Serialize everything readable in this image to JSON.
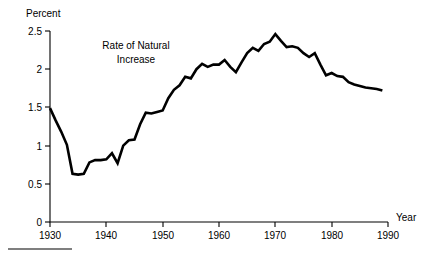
{
  "figure": {
    "background_color": "#ffffff",
    "line_color": "#000000",
    "axis_color": "#000000"
  },
  "labels": {
    "y_axis_title": "Percent",
    "x_axis_title": "Year",
    "annotation_line1": "Rate of Natural",
    "annotation_line2": "Increase"
  },
  "chart_data": {
    "type": "line",
    "title": "",
    "subtitle": "",
    "xlabel": "Year",
    "ylabel": "Percent",
    "xlim": [
      1930,
      1990
    ],
    "ylim": [
      0,
      2.5
    ],
    "grid": false,
    "legend": "none",
    "annotations": [
      {
        "text": "Rate of Natural Increase",
        "x": 1945,
        "y": 2.3
      }
    ],
    "y_ticks": [
      0,
      0.5,
      1,
      1.5,
      2,
      2.5
    ],
    "y_tick_labels": [
      "0",
      "0.5",
      "1",
      "1.5",
      "2",
      "2.5"
    ],
    "x_ticks": [
      1930,
      1940,
      1950,
      1960,
      1970,
      1980,
      1990
    ],
    "x_tick_labels": [
      "1930",
      "1940",
      "1950",
      "1960",
      "1970",
      "1980",
      "1990"
    ],
    "series": [
      {
        "name": "Rate of Natural Increase",
        "color": "#000000",
        "x": [
          1930,
          1931,
          1932,
          1933,
          1934,
          1935,
          1936,
          1937,
          1938,
          1939,
          1940,
          1941,
          1942,
          1943,
          1944,
          1945,
          1946,
          1947,
          1948,
          1949,
          1950,
          1951,
          1952,
          1953,
          1954,
          1955,
          1956,
          1957,
          1958,
          1959,
          1960,
          1961,
          1962,
          1963,
          1964,
          1965,
          1966,
          1967,
          1968,
          1969,
          1970,
          1971,
          1972,
          1973,
          1974,
          1975,
          1976,
          1977,
          1978,
          1979,
          1980,
          1981,
          1982,
          1983,
          1984,
          1985,
          1986,
          1987,
          1988,
          1989
        ],
        "values": [
          1.49,
          1.33,
          1.18,
          1.01,
          0.63,
          0.62,
          0.63,
          0.78,
          0.81,
          0.81,
          0.82,
          0.9,
          0.77,
          1.0,
          1.07,
          1.08,
          1.28,
          1.43,
          1.42,
          1.44,
          1.46,
          1.62,
          1.73,
          1.79,
          1.9,
          1.88,
          2.0,
          2.07,
          2.03,
          2.06,
          2.06,
          2.12,
          2.03,
          1.96,
          2.09,
          2.21,
          2.28,
          2.24,
          2.33,
          2.36,
          2.46,
          2.37,
          2.29,
          2.3,
          2.28,
          2.21,
          2.16,
          2.21,
          2.06,
          1.92,
          1.95,
          1.91,
          1.9,
          1.83,
          1.8,
          1.78,
          1.76,
          1.75,
          1.74,
          1.72
        ]
      }
    ]
  },
  "pixel_geometry": {
    "x_left": 50,
    "x_right": 388,
    "y_bottom": 222,
    "y_top": 31
  }
}
